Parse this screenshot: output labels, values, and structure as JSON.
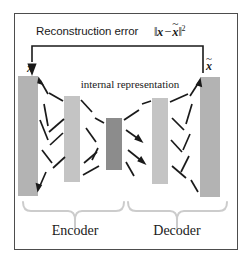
{
  "diagram": {
    "title_label": "Reconstruction error",
    "error_math": {
      "input_symbol": "x",
      "recon_symbol": "x",
      "tilde": "~",
      "norm_open": "‖",
      "norm_close": "‖",
      "minus": "−",
      "exponent": "2"
    },
    "input_label": "x",
    "output_label": "x",
    "output_tilde": "~",
    "internal_representation_label": "internal representation",
    "encoder_label": "Encoder",
    "decoder_label": "Decoder",
    "colors": {
      "frame_border": "#4d4d4d",
      "background": "#ffffff",
      "bar_outer": "#b3b3b3",
      "bar_middle": "#c4c4c4",
      "bar_bottleneck": "#8c8c8c",
      "arrow": "#1a1a1a",
      "brace": "#cccccc",
      "text": "#1a1a1a"
    },
    "layers": [
      {
        "name": "input-layer",
        "x": 18,
        "y": 76,
        "width": 20,
        "height": 120,
        "shade": "bar_outer"
      },
      {
        "name": "encoder-hidden-layer",
        "x": 64,
        "y": 96,
        "width": 16,
        "height": 86,
        "shade": "bar_middle"
      },
      {
        "name": "bottleneck-layer",
        "x": 106,
        "y": 118,
        "width": 16,
        "height": 52,
        "shade": "bar_bottleneck"
      },
      {
        "name": "decoder-hidden-layer",
        "x": 152,
        "y": 98,
        "width": 16,
        "height": 86,
        "shade": "bar_middle"
      },
      {
        "name": "output-layer",
        "x": 200,
        "y": 77,
        "width": 20,
        "height": 120,
        "shade": "bar_outer"
      }
    ],
    "sections": [
      {
        "name": "encoder",
        "label": "Encoder"
      },
      {
        "name": "decoder",
        "label": "Decoder"
      }
    ]
  }
}
